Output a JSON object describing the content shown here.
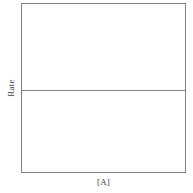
{
  "figure": {
    "background_color": "#ffffff",
    "frame_color": "#808080",
    "line_color": "#828282",
    "text_color": "#3d3d3d"
  },
  "axes": {
    "x_title": "[A]",
    "y_title": "Rate"
  },
  "chart_data": {
    "type": "line",
    "title": "",
    "subtitle": "",
    "xlabel": "[A]",
    "ylabel": "Rate",
    "xlim": [
      0,
      1
    ],
    "ylim": [
      0,
      1
    ],
    "xticks": [],
    "yticks": [],
    "xticklabels": [],
    "yticklabels": [],
    "grid": false,
    "legend": null,
    "annotations": [],
    "series": [
      {
        "name": "Rate vs [A]",
        "color": "#828282",
        "x": [
          0,
          0.1,
          0.2,
          0.3,
          0.4,
          0.5,
          0.6,
          0.7,
          0.8,
          0.9,
          1
        ],
        "values": [
          0.49,
          0.49,
          0.49,
          0.49,
          0.49,
          0.49,
          0.49,
          0.49,
          0.49,
          0.49,
          0.49
        ],
        "y_constant": 0.49,
        "description": "Horizontal line spanning the full x-range at constant Rate"
      }
    ]
  }
}
